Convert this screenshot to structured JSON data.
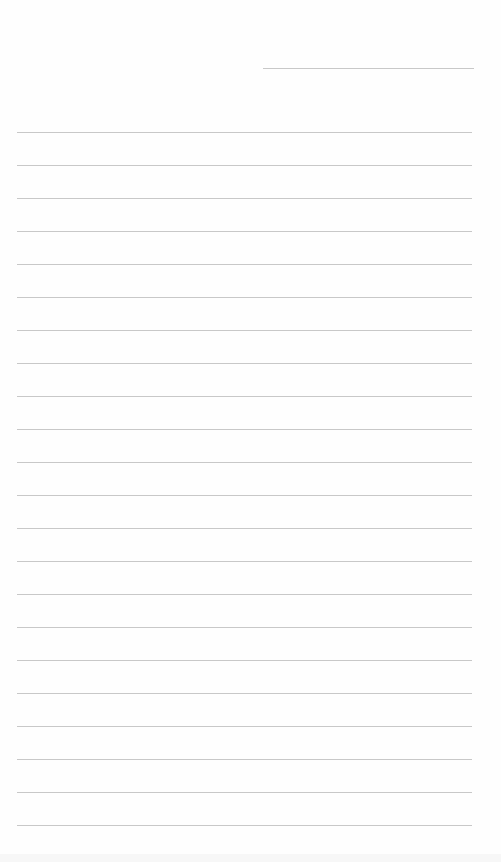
{
  "document": {
    "type": "blank ruled sheet",
    "background_color": "#ffffff",
    "line_color": "#c8c8c8",
    "header_line": {
      "top": 68,
      "left": 263,
      "width": 211,
      "label": ""
    },
    "ruled_lines": {
      "count": 22,
      "first_top": 132,
      "spacing": 33,
      "left": 17,
      "width": 455,
      "text": [
        "",
        "",
        "",
        "",
        "",
        "",
        "",
        "",
        "",
        "",
        "",
        "",
        "",
        "",
        "",
        "",
        "",
        "",
        "",
        "",
        "",
        ""
      ]
    }
  }
}
